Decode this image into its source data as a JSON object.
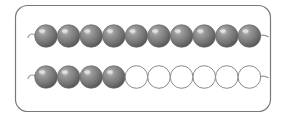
{
  "diagram": {
    "title": "",
    "frame": {
      "stroke": "#7a7a7a",
      "fill": "#ffffff"
    },
    "colors": {
      "filled": "#7d7d7d",
      "filled_highlight": "#cfcfcf",
      "empty_stroke": "#8a8a8a",
      "string": "#9a9a9a"
    },
    "rows": [
      {
        "label": "row-1",
        "total_beads": 10,
        "filled_beads": 10
      },
      {
        "label": "row-2",
        "total_beads": 10,
        "filled_beads": 4
      }
    ]
  }
}
